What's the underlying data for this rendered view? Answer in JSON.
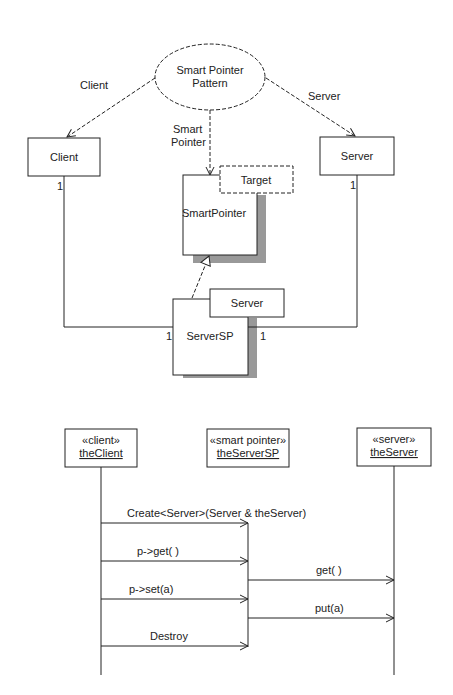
{
  "collaboration": {
    "pattern": {
      "line1": "Smart Pointer",
      "line2": "Pattern"
    },
    "roles": {
      "client": "Client",
      "smart_pointer_1": "Smart",
      "smart_pointer_2": "Pointer",
      "server": "Server"
    },
    "classes": {
      "client": "Client",
      "server": "Server",
      "smartpointer": "SmartPointer",
      "smartpointer_param": "Target",
      "serversp": "ServerSP",
      "serversp_param": "Server"
    },
    "multiplicities": {
      "client_end": "1",
      "server_end": "1",
      "serversp_left": "1",
      "serversp_right": "1"
    }
  },
  "sequence": {
    "lifelines": [
      {
        "stereotype": "«client»",
        "name": "theClient"
      },
      {
        "stereotype": "«smart pointer»",
        "name": "theServerSP"
      },
      {
        "stereotype": "«server»",
        "name": "theServer"
      }
    ],
    "messages": [
      {
        "label": "Create<Server>(Server & theServer)"
      },
      {
        "label": "p->get( )"
      },
      {
        "label": "get( )"
      },
      {
        "label": "p->set(a)"
      },
      {
        "label": "put(a)"
      },
      {
        "label": "Destroy"
      }
    ]
  }
}
